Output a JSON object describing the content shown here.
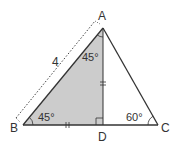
{
  "diagram": {
    "type": "geometry-triangle",
    "vertices": {
      "A": {
        "label": "A",
        "x": 103,
        "y": 28
      },
      "B": {
        "label": "B",
        "x": 23,
        "y": 125
      },
      "C": {
        "label": "C",
        "x": 158,
        "y": 125
      },
      "D": {
        "label": "D",
        "x": 103,
        "y": 125
      }
    },
    "segments": [
      "AB",
      "AC",
      "BC",
      "AD"
    ],
    "shaded_region": "ABD",
    "side_length_label": {
      "side": "AB",
      "text": "4"
    },
    "angles": {
      "A_in_ABD": "45°",
      "B": "45°",
      "C": "60°",
      "D": "right angle"
    },
    "equal_marks": [
      "AD",
      "BD"
    ],
    "colors": {
      "stroke": "#333333",
      "shade": "#cccccc",
      "background": "#ffffff"
    }
  }
}
